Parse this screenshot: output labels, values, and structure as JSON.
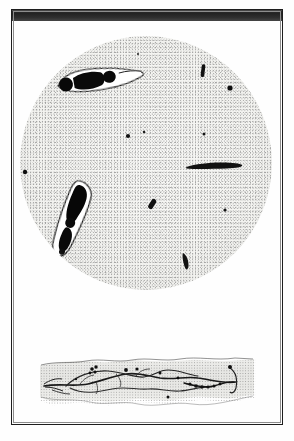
{
  "plate": {
    "kind": "scanned-scientific-plate",
    "caption": "",
    "background_color": "#fefefe",
    "frame_color": "#1d1d1d",
    "top_bar_color": "#2b2b2b"
  },
  "figures": [
    {
      "id": "upper-field",
      "name": "circular-microscope-field",
      "label": "",
      "shape": "circle",
      "center": [
        146,
        163
      ],
      "radius": 126,
      "field_tone": "#f4f4f1",
      "stipple": true,
      "specimens": [
        {
          "name": "large-organism-upper",
          "type": "elongated-flagellate",
          "x": 56,
          "y": 68,
          "w": 62,
          "h": 19,
          "rotate": -12,
          "fill": "#0d0d0d",
          "halo": "#fdfdfd"
        },
        {
          "name": "large-organism-lower",
          "type": "elongated-flagellate",
          "x": 62,
          "y": 178,
          "w": 26,
          "h": 72,
          "rotate": 18,
          "fill": "#0d0d0d",
          "halo": "#fdfdfd"
        },
        {
          "name": "long-rod",
          "type": "bacillus",
          "x": 188,
          "y": 166,
          "w": 54,
          "h": 5,
          "rotate": -5,
          "fill": "#111111"
        },
        {
          "name": "short-rod-top-right",
          "type": "bacillus",
          "x": 203,
          "y": 66,
          "w": 4,
          "h": 13,
          "rotate": 8,
          "fill": "#111111"
        },
        {
          "name": "short-rod-mid",
          "type": "bacillus",
          "x": 154,
          "y": 200,
          "w": 6,
          "h": 11,
          "rotate": 28,
          "fill": "#111111"
        },
        {
          "name": "short-rod-low",
          "type": "bacillus",
          "x": 180,
          "y": 258,
          "w": 6,
          "h": 18,
          "rotate": -22,
          "fill": "#111111"
        },
        {
          "name": "dot-left-margin",
          "type": "coccus",
          "x": 22,
          "y": 175,
          "d": 4
        },
        {
          "name": "dot-upper-right",
          "type": "coccus",
          "x": 230,
          "y": 89,
          "d": 5
        },
        {
          "name": "dot-upper-mid",
          "type": "coccus",
          "x": 203,
          "y": 136,
          "d": 3
        },
        {
          "name": "dot-center-left",
          "type": "coccus",
          "x": 128,
          "y": 138,
          "d": 4
        },
        {
          "name": "dot-center",
          "type": "coccus",
          "x": 144,
          "y": 135,
          "d": 2
        },
        {
          "name": "dot-right-mid",
          "type": "coccus",
          "x": 224,
          "y": 212,
          "d": 3
        }
      ]
    },
    {
      "id": "lower-section",
      "name": "tissue-section-strip",
      "label": "",
      "shape": "horizontal-band",
      "bounds": [
        40,
        356,
        216,
        56
      ],
      "tissue_tone": "#e8e8e5",
      "structures": [
        {
          "name": "nerve-fibre-main",
          "type": "branching-fibre",
          "stroke": "#1a1a1a",
          "width": 1.6
        },
        {
          "name": "nerve-fibre-secondary",
          "type": "branching-fibre",
          "stroke": "#262626",
          "width": 1.2
        },
        {
          "name": "beaded-fibre-right",
          "type": "beaded-fibre",
          "stroke": "#141414",
          "width": 1.4
        },
        {
          "name": "nuclei-cluster-left",
          "type": "nuclei",
          "count": 4,
          "fill": "#101010"
        },
        {
          "name": "nuclei-scatter-right",
          "type": "nuclei",
          "count": 5,
          "fill": "#101010"
        }
      ]
    }
  ]
}
